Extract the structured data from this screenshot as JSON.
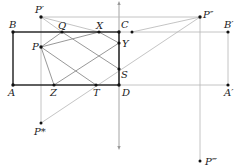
{
  "diagram": {
    "type": "geometry-reflection-diagram",
    "points": {
      "B": {
        "label": "B",
        "x": 13,
        "y": 32
      },
      "A": {
        "label": "A",
        "x": 13,
        "y": 85
      },
      "C": {
        "label": "C",
        "x": 119,
        "y": 32
      },
      "D": {
        "label": "D",
        "x": 119,
        "y": 85
      },
      "P": {
        "label": "P",
        "x": 41,
        "y": 47
      },
      "P1": {
        "label": "P′",
        "x": 41,
        "y": 17
      },
      "P2": {
        "label": "P″",
        "x": 200,
        "y": 17
      },
      "P3": {
        "label": "P‴",
        "x": 200,
        "y": 161
      },
      "Ps": {
        "label": "P*",
        "x": 41,
        "y": 123
      },
      "Q": {
        "label": "Q",
        "x": 62,
        "y": 32
      },
      "X": {
        "label": "X",
        "x": 99,
        "y": 32
      },
      "Y": {
        "label": "Y",
        "x": 119,
        "y": 43
      },
      "S": {
        "label": "S",
        "x": 119,
        "y": 69
      },
      "Z": {
        "label": "Z",
        "x": 54,
        "y": 85
      },
      "T": {
        "label": "T",
        "x": 96,
        "y": 85
      },
      "B2": {
        "label": "B′",
        "x": 228,
        "y": 32
      },
      "A2": {
        "label": "A′",
        "x": 228,
        "y": 85
      },
      "E": {
        "label": "",
        "x": 132,
        "y": 32
      }
    },
    "labels": {
      "B": "B",
      "A": "A",
      "C": "C",
      "D": "D",
      "P": "P",
      "P1": "P′",
      "P2": "P″",
      "P3": "P‴",
      "Ps": "P*",
      "Q": "Q",
      "X": "X",
      "Y": "Y",
      "S": "S",
      "Z": "Z",
      "T": "T",
      "B2": "B′",
      "A2": "A′"
    },
    "rectangle": [
      "A",
      "B",
      "C",
      "D"
    ],
    "segments": [
      [
        "P",
        "Q"
      ],
      [
        "P",
        "X"
      ],
      [
        "P",
        "Z"
      ],
      [
        "P",
        "T"
      ],
      [
        "Q",
        "S"
      ],
      [
        "X",
        "Y"
      ],
      [
        "Z",
        "Y"
      ],
      [
        "T",
        "S"
      ],
      [
        "P1",
        "Q"
      ],
      [
        "P1",
        "X"
      ],
      [
        "P1",
        "P2"
      ],
      [
        "P2",
        "E"
      ],
      [
        "P2",
        "Ps"
      ],
      [
        "P1",
        "Ps"
      ],
      [
        "P2",
        "P3"
      ],
      [
        "B",
        "B2"
      ],
      [
        "A",
        "A2"
      ],
      [
        "B2",
        "A2"
      ]
    ],
    "axis": {
      "x": 119,
      "y_top": 2,
      "y_bottom": 148,
      "arrows": "both"
    }
  }
}
